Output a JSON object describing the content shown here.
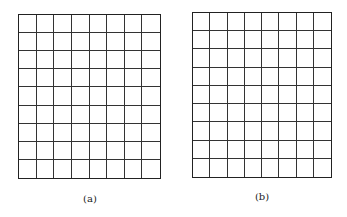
{
  "panels": [
    {
      "label": "(a)",
      "cols": 8,
      "rows": 9,
      "x": 18,
      "y": 14,
      "width": 143,
      "height": 165,
      "label_x": 70,
      "label_y": 193
    },
    {
      "label": "(b)",
      "cols": 8,
      "rows": 9,
      "x": 192,
      "y": 12,
      "width": 140,
      "height": 166,
      "label_x": 242,
      "label_y": 191
    }
  ],
  "colors": {
    "line": "#222222",
    "background": "#ffffff"
  }
}
